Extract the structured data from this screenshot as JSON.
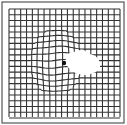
{
  "figure": {
    "type": "amsler-grid",
    "width": 127,
    "height": 125,
    "frame": {
      "x": 2,
      "y": 2,
      "w": 122,
      "h": 121,
      "stroke": "#555555"
    },
    "grid": {
      "x0": 9,
      "y0": 9,
      "x1": 120,
      "y1": 118,
      "cols": 19,
      "rows": 19,
      "stroke": "#333333"
    },
    "fixation_dot": {
      "cx": 64,
      "cy": 63,
      "r": 2.2,
      "color": "#111111"
    },
    "distortion": {
      "cx": 56,
      "cy": 62,
      "rx": 20,
      "ry": 26
    },
    "scotoma": {
      "color": "#ffffff"
    }
  }
}
